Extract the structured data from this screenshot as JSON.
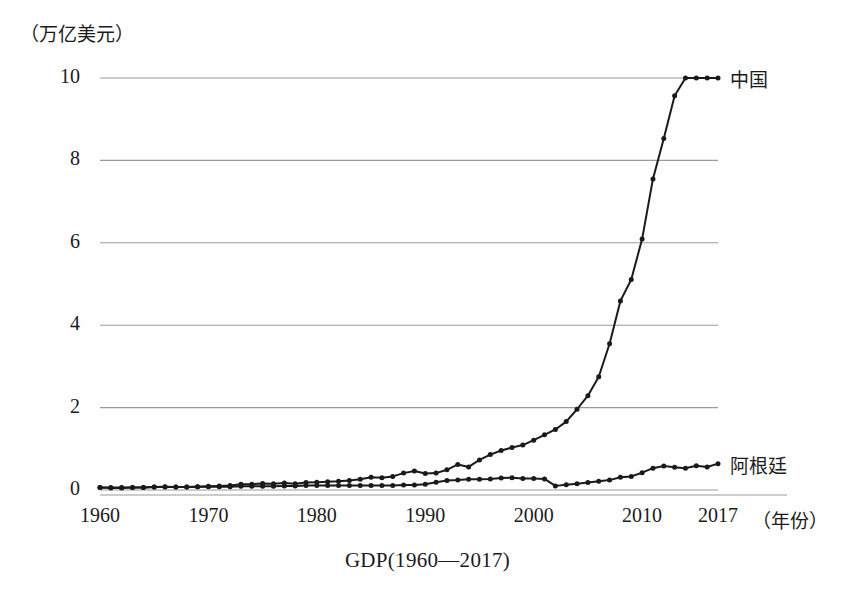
{
  "figure": {
    "caption": "GDP(1960—2017)",
    "y_unit_label": "（万亿美元）",
    "x_unit_label": "（年份）"
  },
  "chart_data": {
    "type": "line",
    "title": "GDP(1960—2017)",
    "xlabel": "（年份）",
    "ylabel": "（万亿美元）",
    "xlim": [
      1960,
      2017
    ],
    "ylim": [
      0,
      10
    ],
    "grid": true,
    "grid_axis": "y",
    "legend_position": "right-of-line-end",
    "yticks": [
      0,
      2,
      4,
      6,
      8,
      10
    ],
    "ytick_labels": [
      "0",
      "2",
      "4",
      "6",
      "8",
      "10"
    ],
    "xticks": [
      1960,
      1970,
      1980,
      1990,
      2000,
      2010,
      2017
    ],
    "xtick_labels": [
      "1960",
      "1970",
      "1980",
      "1990",
      "2000",
      "2010",
      "2017"
    ],
    "markers": "filled-circle",
    "line_color": "#1a1a1a",
    "grid_color": "#9a9a9a",
    "x": [
      1960,
      1961,
      1962,
      1963,
      1964,
      1965,
      1966,
      1967,
      1968,
      1969,
      1970,
      1971,
      1972,
      1973,
      1974,
      1975,
      1976,
      1977,
      1978,
      1979,
      1980,
      1981,
      1982,
      1983,
      1984,
      1985,
      1986,
      1987,
      1988,
      1989,
      1990,
      1991,
      1992,
      1993,
      1994,
      1995,
      1996,
      1997,
      1998,
      1999,
      2000,
      2001,
      2002,
      2003,
      2004,
      2005,
      2006,
      2007,
      2008,
      2009,
      2010,
      2011,
      2012,
      2013,
      2014,
      2015,
      2016,
      2017
    ],
    "series": [
      {
        "name": "中国",
        "label": "中国",
        "values": [
          0.06,
          0.05,
          0.05,
          0.06,
          0.06,
          0.07,
          0.08,
          0.07,
          0.07,
          0.08,
          0.09,
          0.1,
          0.11,
          0.14,
          0.14,
          0.16,
          0.15,
          0.17,
          0.15,
          0.18,
          0.19,
          0.2,
          0.21,
          0.23,
          0.26,
          0.31,
          0.3,
          0.33,
          0.41,
          0.46,
          0.4,
          0.41,
          0.49,
          0.62,
          0.56,
          0.73,
          0.86,
          0.96,
          1.03,
          1.09,
          1.21,
          1.34,
          1.47,
          1.66,
          1.96,
          2.29,
          2.75,
          3.55,
          4.59,
          5.11,
          6.09,
          7.55,
          8.53,
          9.57,
          10.48,
          11.06,
          11.23,
          10.1
        ]
      },
      {
        "name": "阿根廷",
        "label": "阿根廷",
        "values": [
          0.06,
          0.06,
          0.06,
          0.06,
          0.06,
          0.07,
          0.07,
          0.07,
          0.07,
          0.08,
          0.08,
          0.08,
          0.08,
          0.09,
          0.09,
          0.09,
          0.09,
          0.1,
          0.1,
          0.11,
          0.11,
          0.11,
          0.11,
          0.11,
          0.11,
          0.11,
          0.11,
          0.11,
          0.12,
          0.12,
          0.14,
          0.19,
          0.23,
          0.24,
          0.26,
          0.26,
          0.27,
          0.29,
          0.3,
          0.28,
          0.28,
          0.27,
          0.1,
          0.13,
          0.15,
          0.18,
          0.21,
          0.24,
          0.31,
          0.33,
          0.42,
          0.53,
          0.58,
          0.55,
          0.53,
          0.59,
          0.56,
          0.64
        ]
      }
    ]
  }
}
